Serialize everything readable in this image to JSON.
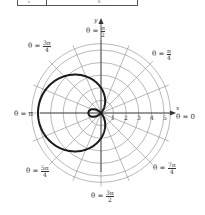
{
  "table_fragment": {
    "cells": [
      "r",
      "θ"
    ]
  },
  "graph": {
    "equation_shape": "limaçon with inner loop (r = 2 − 3cos θ)",
    "axis_labels": {
      "x": "x",
      "y": "y"
    },
    "radial_tick_labels": [
      "1",
      "2",
      "3",
      "4",
      "5"
    ],
    "angle_labels": [
      {
        "key": "theta_0",
        "prefix": "θ = ",
        "value": "0"
      },
      {
        "key": "theta_pi_4",
        "prefix": "θ = ",
        "num": "π",
        "den": "4"
      },
      {
        "key": "theta_pi_2",
        "prefix": "θ = ",
        "num": "π",
        "den": "2"
      },
      {
        "key": "theta_3pi_4",
        "prefix": "θ = ",
        "num": "3π",
        "den": "4"
      },
      {
        "key": "theta_pi",
        "prefix": "θ = ",
        "value": "π"
      },
      {
        "key": "theta_5pi_4",
        "prefix": "θ = ",
        "num": "5π",
        "den": "4"
      },
      {
        "key": "theta_3pi_2",
        "prefix": "θ = ",
        "num": "3π",
        "den": "2"
      },
      {
        "key": "theta_7pi_4",
        "prefix": "θ = ",
        "num": "7π",
        "den": "4"
      }
    ],
    "grid": {
      "circles": [
        1,
        2,
        3,
        4,
        5
      ],
      "radial_line_step": "π/8"
    },
    "colors": {
      "curve": "#1a1a1a",
      "grid": "#8a8a8a",
      "axis": "#333333"
    }
  }
}
